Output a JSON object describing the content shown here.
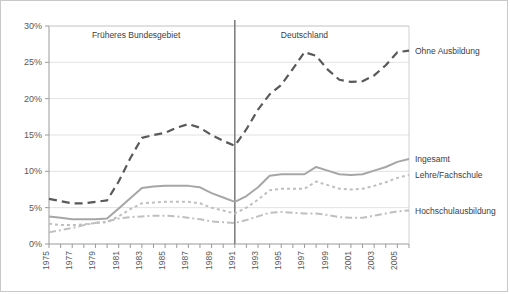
{
  "chart_data": {
    "type": "line",
    "title": "",
    "xlabel": "",
    "ylabel": "",
    "ylim": [
      0,
      30
    ],
    "ytick_labels": [
      "0%",
      "5%",
      "10%",
      "15%",
      "20%",
      "25%",
      "30%"
    ],
    "ytick_values": [
      0,
      5,
      10,
      15,
      20,
      25,
      30
    ],
    "grid": "horizontal",
    "legend_position": "right-of-plot (inline series labels)",
    "x": [
      1975,
      1976,
      1977,
      1978,
      1979,
      1980,
      1981,
      1982,
      1983,
      1984,
      1985,
      1986,
      1987,
      1988,
      1989,
      1990,
      1991,
      1992,
      1993,
      1994,
      1995,
      1996,
      1997,
      1998,
      1999,
      2000,
      2001,
      2002,
      2003,
      2004,
      2005,
      2006
    ],
    "xtick_labels": [
      "1975",
      "1977",
      "1979",
      "1981",
      "1983",
      "1985",
      "1987",
      "1989",
      "1991",
      "1993",
      "1995",
      "1997",
      "1999",
      "2001",
      "2003",
      "2005"
    ],
    "annotations": [
      {
        "text": "Früheres Bundesgebiet",
        "x": 1982.5,
        "y": 28.3
      },
      {
        "text": "Deutschland",
        "x": 1997.0,
        "y": 28.3
      }
    ],
    "divider": {
      "x": 1991,
      "label": "Wiedervereinigung divider"
    },
    "series": [
      {
        "name": "Ohne Ausbildung",
        "style": "dashed",
        "color": "#595959",
        "width": 2.2,
        "values": [
          6.2,
          5.9,
          5.6,
          5.6,
          5.8,
          6.0,
          8.6,
          11.8,
          14.6,
          15.0,
          15.3,
          16.0,
          16.5,
          16.0,
          15.0,
          14.2,
          13.5,
          15.8,
          18.5,
          20.6,
          21.9,
          24.1,
          26.4,
          25.9,
          24.0,
          22.6,
          22.3,
          22.4,
          23.2,
          24.6,
          26.4,
          26.6
        ]
      },
      {
        "name": "Ingesamt",
        "style": "solid",
        "color": "#a6a6a6",
        "width": 2.0,
        "values": [
          3.8,
          3.6,
          3.4,
          3.4,
          3.4,
          3.5,
          4.9,
          6.3,
          7.7,
          7.9,
          8.0,
          8.0,
          8.0,
          7.8,
          7.0,
          6.4,
          5.8,
          6.6,
          7.8,
          9.4,
          9.6,
          9.6,
          9.6,
          10.6,
          10.1,
          9.6,
          9.5,
          9.6,
          10.1,
          10.6,
          11.3,
          11.7
        ]
      },
      {
        "name": "Lehre/Fachschule",
        "style": "dotted",
        "color": "#bfbfbf",
        "width": 2.0,
        "values": [
          2.8,
          2.6,
          2.6,
          2.7,
          2.9,
          3.0,
          3.8,
          4.8,
          5.6,
          5.7,
          5.8,
          5.8,
          5.8,
          5.6,
          5.0,
          4.6,
          4.2,
          5.0,
          6.1,
          7.4,
          7.6,
          7.6,
          7.6,
          8.6,
          8.1,
          7.6,
          7.5,
          7.6,
          8.0,
          8.5,
          9.1,
          9.5
        ]
      },
      {
        "name": "Hochschulausbildung",
        "style": "dashdot",
        "color": "#bfbfbf",
        "width": 2.0,
        "values": [
          1.6,
          1.9,
          2.2,
          2.6,
          2.9,
          3.1,
          3.5,
          3.7,
          3.8,
          3.9,
          3.9,
          3.8,
          3.6,
          3.4,
          3.1,
          3.0,
          2.9,
          3.3,
          3.8,
          4.3,
          4.4,
          4.3,
          4.2,
          4.2,
          4.0,
          3.7,
          3.6,
          3.6,
          3.9,
          4.2,
          4.5,
          4.6
        ]
      }
    ]
  }
}
